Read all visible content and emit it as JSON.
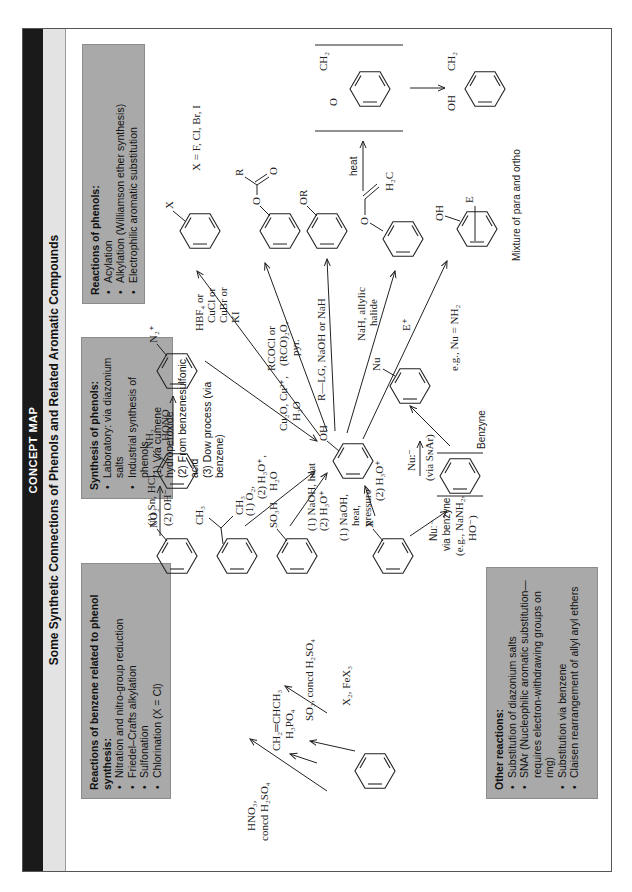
{
  "header": {
    "label": "CONCEPT MAP",
    "title": "Some Synthetic Connections of Phenols and Related Aromatic Compounds"
  },
  "boxes": {
    "benzene_reactions": {
      "heading": "Reactions of benzene related to phenol synthesis:",
      "items": [
        "Nitration and nitro-group reduction",
        "Friedel–Crafts alkylation",
        "Sulfonation",
        "Chlorination (X = Cl)"
      ]
    },
    "synthesis_of_phenols": {
      "heading": "Synthesis of phenols:",
      "items": [
        "Laboratory: via diazonium salts",
        "Industrial synthesis of phenols"
      ],
      "subitems": [
        "(1) Via cumene hydroperoxide",
        "(2) From benzenesulfonic acid",
        "(3) Dow process (via benzene)"
      ]
    },
    "reactions_of_phenols": {
      "heading": "Reactions of phenols:",
      "items": [
        "Acylation",
        "Alkylation (Williamson ether synthesis)",
        "Electrophilic aromatic substitution"
      ]
    },
    "other_reactions": {
      "heading": "Other reactions:",
      "items": [
        "Substitution of diazonium salts",
        "SNAr (Nucleophilic aromatic substitution—requires electron-withdrawing groups on ring)",
        "Substitution via benzene",
        "Claisen rearrangement of allyl aryl ethers"
      ]
    }
  },
  "compounds": {
    "benzene": "",
    "nitrobenzene": "NO₂",
    "cumene_ch3_a": "CH₃",
    "cumene_ch3_b": "CH₃",
    "benzenesulfonic": "SO₃H",
    "halobenzene": "X",
    "aniline": "NH₂",
    "diazonium": "N₂⁺",
    "phenol": "OH",
    "aryl_halide": "X",
    "aryl_halide_note": "X = F, Cl, Br, I",
    "ester_o": "O",
    "ester_r": "R",
    "ester_carbonyl": "O",
    "ether": "OR",
    "allyl_ether_o": "O",
    "allyl_ether_h2c": "H₂C",
    "dienone_o": "O",
    "dienone_ch2": "CH₂",
    "allylphenol_oh": "OH",
    "allylphenol_ch2": "CH₂",
    "eas_oh": "OH",
    "eas_e": "E",
    "eas_note": "Mixture of para and ortho",
    "substituted_nu": "Nu",
    "nu_note": "e.g., Nu = NH₂",
    "benzyne_label": "Benzyne"
  },
  "reagents": {
    "nitration": [
      "HNO₃,",
      "concd H₂SO₄"
    ],
    "alkylation": [
      "CH₂═CHCH₃",
      "H₃PO₄"
    ],
    "sulfonation": [
      "SO₃, concd H₂SO₄"
    ],
    "halogenation": [
      "X₂, FeX₃"
    ],
    "reduction": [
      "(1) Sn, HCl",
      "(2) OH⁻"
    ],
    "diazotization": [
      "HONO"
    ],
    "diazonium_hydrolysis": [
      "Cu₂O, Cu²⁺,",
      "H₂O"
    ],
    "cumene": [
      "(1) O₂,",
      "(2) H₃O⁺,",
      "H₂O"
    ],
    "sulfonic_fusion": [
      "(1) NaOH, heat",
      "(2) H₃O⁺"
    ],
    "dow": [
      "(1) NaOH,",
      "heat,",
      "pressure",
      "(2) H₃O⁺"
    ],
    "halide_sub": [
      "HBF₄ or",
      "CuCl or",
      "CuBr or",
      "KI"
    ],
    "acylation": [
      "RCOCl or",
      "(RCO)₂O,",
      "pyr."
    ],
    "williamson": [
      "R—LG, NaOH or NaH"
    ],
    "allylation": [
      "NaH, allylic",
      "halide"
    ],
    "eas": [
      "E⁺"
    ],
    "claisen": [
      "heat"
    ],
    "benzyne_formation": [
      "Nu:⁻",
      "via benzyne",
      "(e.g., NaNH₂,",
      "HO⁻)"
    ],
    "snar": [
      "Nu:⁻",
      "(via SɴAr)"
    ]
  }
}
